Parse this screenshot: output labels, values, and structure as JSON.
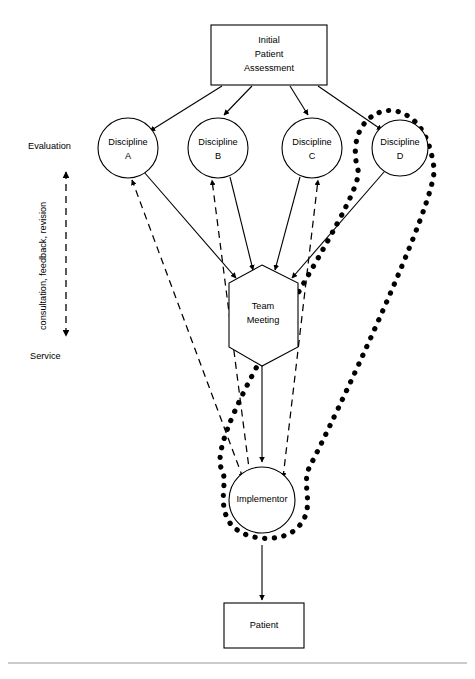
{
  "diagram": {
    "title_text": "Interdisciplinary team service delivery model",
    "nodes": {
      "assessment": {
        "line1": "Initial",
        "line2": "Patient",
        "line3": "Assessment"
      },
      "discipline_a": {
        "line1": "Discipline",
        "line2": "A"
      },
      "discipline_b": {
        "line1": "Discipline",
        "line2": "B"
      },
      "discipline_c": {
        "line1": "Discipline",
        "line2": "C"
      },
      "discipline_d": {
        "line1": "Discipline",
        "line2": "D"
      },
      "team_meeting": {
        "line1": "Team",
        "line2": "Meeting"
      },
      "implementor": {
        "line1": "Implementor"
      },
      "patient": {
        "line1": "Patient"
      }
    },
    "axis": {
      "top_label": "Evaluation",
      "bottom_label": "Service",
      "side_label": "consultation, feedback, revision"
    },
    "colors": {
      "stroke": "#000000",
      "fill": "#ffffff",
      "rule": "#9a9a9a"
    }
  }
}
